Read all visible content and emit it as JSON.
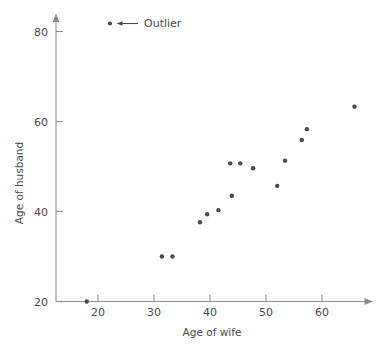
{
  "chart_data": {
    "type": "scatter",
    "title": "",
    "xlabel": "Age of wife",
    "ylabel": "Age of husband",
    "xlim": [
      14,
      68
    ],
    "ylim": [
      19,
      84
    ],
    "xticks": [
      20,
      30,
      40,
      50,
      60
    ],
    "yticks": [
      20,
      40,
      60,
      80
    ],
    "xtick_labels": [
      "20",
      "30",
      "40",
      "50",
      "60"
    ],
    "ytick_labels": [
      "20",
      "40",
      "60",
      "80"
    ],
    "grid": false,
    "legend_position": "top-left-inside",
    "series": [
      {
        "name": "couples",
        "marker": "filled-circle",
        "color": "#4a4a4a",
        "points": [
          {
            "x": 18.0,
            "y": 20.0
          },
          {
            "x": 31.4,
            "y": 30.0
          },
          {
            "x": 33.3,
            "y": 30.0
          },
          {
            "x": 38.2,
            "y": 37.6
          },
          {
            "x": 39.5,
            "y": 39.4
          },
          {
            "x": 41.5,
            "y": 40.3
          },
          {
            "x": 43.9,
            "y": 43.5
          },
          {
            "x": 43.6,
            "y": 50.7
          },
          {
            "x": 45.4,
            "y": 50.7
          },
          {
            "x": 47.7,
            "y": 49.6
          },
          {
            "x": 52.0,
            "y": 45.7
          },
          {
            "x": 53.4,
            "y": 51.3
          },
          {
            "x": 56.4,
            "y": 55.9
          },
          {
            "x": 57.3,
            "y": 58.3
          },
          {
            "x": 65.8,
            "y": 63.3
          }
        ]
      }
    ],
    "annotations": [
      {
        "name": "outlier-callout",
        "label": "Outlier",
        "marker": "filled-circle",
        "points_to": {
          "x": 18.0,
          "y": 20.0
        }
      }
    ]
  },
  "axes": {
    "x_title": "Age of wife",
    "y_title": "Age of husband"
  },
  "legend": {
    "outlier_label": "Outlier"
  }
}
